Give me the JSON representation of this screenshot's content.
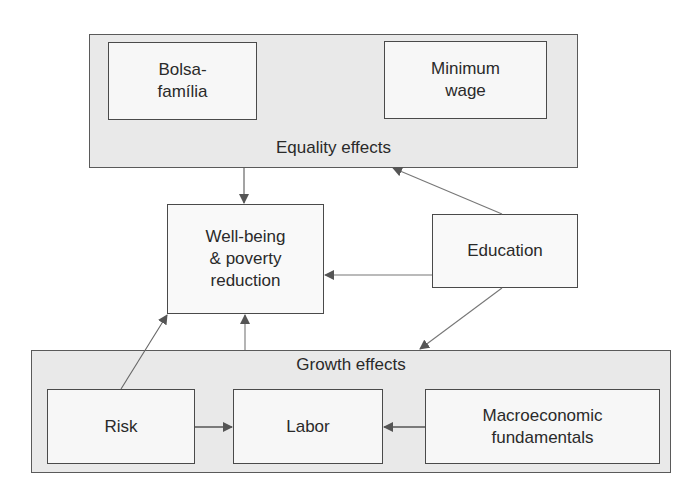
{
  "diagram": {
    "groups": {
      "equality": {
        "label": "Equality effects"
      },
      "growth": {
        "label": "Growth effects"
      }
    },
    "nodes": {
      "bolsa": {
        "label": "Bolsa-\nfamília"
      },
      "minimum_wage": {
        "label": "Minimum\nwage"
      },
      "wellbeing": {
        "label": "Well-being\n& poverty\nreduction"
      },
      "education": {
        "label": "Education"
      },
      "risk": {
        "label": "Risk"
      },
      "labor": {
        "label": "Labor"
      },
      "macro": {
        "label": "Macroeconomic\nfundamentals"
      }
    },
    "edges": [
      {
        "from": "Equality effects",
        "to": "Well-being & poverty reduction"
      },
      {
        "from": "Education",
        "to": "Equality effects"
      },
      {
        "from": "Education",
        "to": "Well-being & poverty reduction"
      },
      {
        "from": "Education",
        "to": "Growth effects"
      },
      {
        "from": "Risk",
        "to": "Well-being & poverty reduction"
      },
      {
        "from": "Growth effects",
        "to": "Well-being & poverty reduction"
      },
      {
        "from": "Risk",
        "to": "Labor"
      },
      {
        "from": "Macroeconomic fundamentals",
        "to": "Labor"
      }
    ],
    "colors": {
      "group_fill": "#e9e9e9",
      "box_fill": "#f7f7f7",
      "stroke": "#4a4a4a",
      "arrow": "#555555"
    }
  }
}
